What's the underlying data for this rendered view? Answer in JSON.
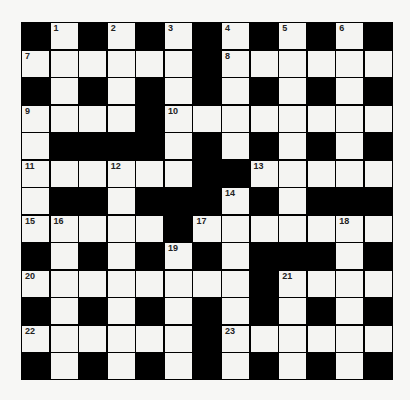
{
  "puzzle": {
    "rows": 13,
    "cols": 13,
    "colors": {
      "block": "#000000",
      "cell": "#f4f4f2",
      "background": "#f7f7f5",
      "number": "#222222"
    },
    "grid": [
      "#.#.#.#.#.#.#",
      "......#......",
      "#.#.#.#.#.#.#",
      "....#........",
      ".####.#.#.#.#",
      "......##.....",
      ".##.###.#.###",
      ".....#.......",
      "#.#.#.#.###.#",
      "........#....",
      "#.#.#.#.#.#.#",
      "......#......",
      "#.#.#.#.#.#.#"
    ],
    "numbers": [
      {
        "r": 0,
        "c": 1,
        "n": "1"
      },
      {
        "r": 0,
        "c": 3,
        "n": "2"
      },
      {
        "r": 0,
        "c": 5,
        "n": "3"
      },
      {
        "r": 0,
        "c": 7,
        "n": "4"
      },
      {
        "r": 0,
        "c": 9,
        "n": "5"
      },
      {
        "r": 0,
        "c": 11,
        "n": "6"
      },
      {
        "r": 1,
        "c": 0,
        "n": "7"
      },
      {
        "r": 1,
        "c": 7,
        "n": "8"
      },
      {
        "r": 3,
        "c": 0,
        "n": "9"
      },
      {
        "r": 3,
        "c": 5,
        "n": "10"
      },
      {
        "r": 5,
        "c": 0,
        "n": "11"
      },
      {
        "r": 5,
        "c": 3,
        "n": "12"
      },
      {
        "r": 5,
        "c": 8,
        "n": "13"
      },
      {
        "r": 6,
        "c": 7,
        "n": "14"
      },
      {
        "r": 7,
        "c": 0,
        "n": "15"
      },
      {
        "r": 7,
        "c": 1,
        "n": "16"
      },
      {
        "r": 7,
        "c": 6,
        "n": "17"
      },
      {
        "r": 7,
        "c": 11,
        "n": "18"
      },
      {
        "r": 8,
        "c": 5,
        "n": "19"
      },
      {
        "r": 9,
        "c": 0,
        "n": "20"
      },
      {
        "r": 9,
        "c": 9,
        "n": "21"
      },
      {
        "r": 11,
        "c": 0,
        "n": "22"
      },
      {
        "r": 11,
        "c": 7,
        "n": "23"
      }
    ]
  }
}
